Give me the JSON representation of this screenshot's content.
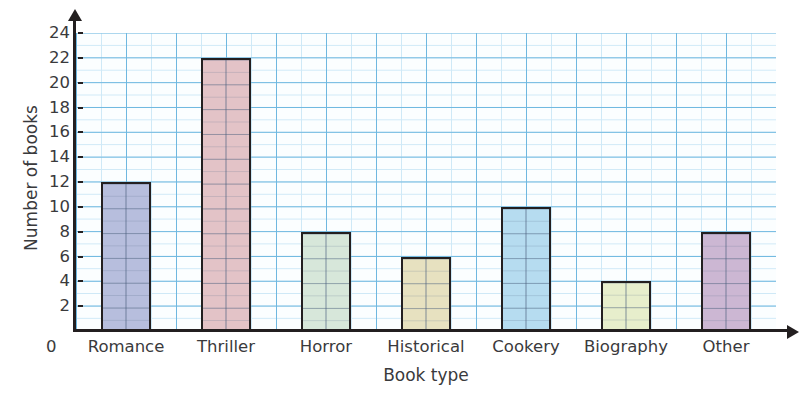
{
  "chart_data": {
    "type": "bar",
    "title": "",
    "xlabel": "Book type",
    "ylabel": "Number of books",
    "categories": [
      "Romance",
      "Thriller",
      "Horror",
      "Historical",
      "Cookery",
      "Biography",
      "Other"
    ],
    "values": [
      12,
      22,
      8,
      6,
      10,
      4,
      8
    ],
    "ylim": [
      0,
      24
    ],
    "ytick_step": 2,
    "yticks": [
      0,
      2,
      4,
      6,
      8,
      10,
      12,
      14,
      16,
      18,
      20,
      22,
      24
    ],
    "ytick_labels": [
      "0",
      "2",
      "4",
      "6",
      "8",
      "10",
      "12",
      "14",
      "16",
      "18",
      "20",
      "22",
      "24"
    ],
    "grid": true,
    "grid_minor": true,
    "legend": false,
    "bar_colors": [
      "#b7bedd",
      "#e3c3c7",
      "#d7e7da",
      "#e7e1c0",
      "#b6dcf0",
      "#e7eecc",
      "#ccb7d3"
    ],
    "bar_outline_color": "#231f20",
    "grid_major_color": "#6fb8e0",
    "grid_minor_color": "#cfe9f7",
    "plot_background": "#fbfeff",
    "axis_color": "#231f20",
    "tick_label_color": "#3a3a3c"
  }
}
